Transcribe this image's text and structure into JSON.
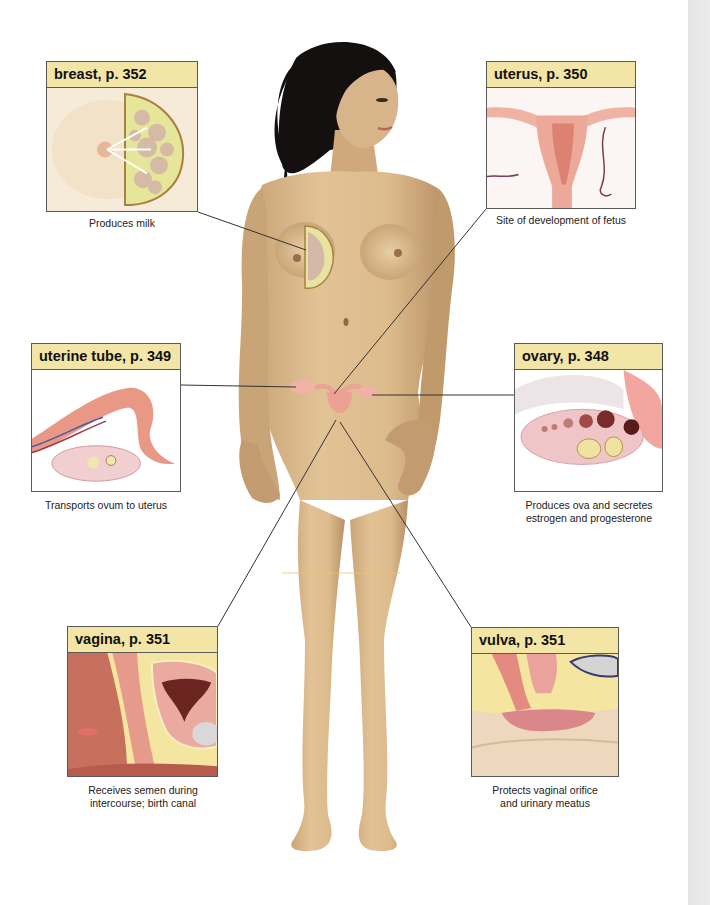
{
  "figure": {
    "colors": {
      "header_bg": "#f3e5a6",
      "box_border": "#5a5a5a",
      "skin": "#d9b98b",
      "hair": "#141010",
      "organ_pink": "#e9a39a",
      "leader_line": "#333333"
    }
  },
  "organs": [
    {
      "id": "breast",
      "label": "breast, p. 352",
      "caption_lines": [
        "Produces milk"
      ]
    },
    {
      "id": "uterus",
      "label": "uterus, p. 350",
      "caption_lines": [
        "Site of development of fetus"
      ]
    },
    {
      "id": "uterine-tube",
      "label": "uterine tube, p. 349",
      "caption_lines": [
        "Transports ovum to uterus"
      ]
    },
    {
      "id": "ovary",
      "label": "ovary, p. 348",
      "caption_lines": [
        "Produces ova and secretes",
        "estrogen and progesterone"
      ]
    },
    {
      "id": "vagina",
      "label": "vagina, p. 351",
      "caption_lines": [
        "Receives semen during",
        "intercourse; birth canal"
      ]
    },
    {
      "id": "vulva",
      "label": "vulva, p. 351",
      "caption_lines": [
        "Protects vaginal orifice",
        "and urinary meatus"
      ]
    }
  ]
}
